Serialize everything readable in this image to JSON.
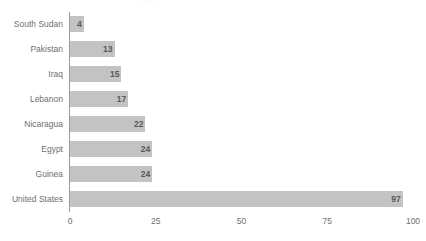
{
  "title_fragment": "stav",
  "chart_data": {
    "type": "bar",
    "orientation": "horizontal",
    "title": "",
    "xlabel": "",
    "ylabel": "",
    "xlim": [
      0,
      100
    ],
    "xticks": [
      "0",
      "25",
      "50",
      "75",
      "100"
    ],
    "grid": false,
    "legend": false,
    "bar_color": "#c3c3c3",
    "axis_color": "#9a9a9a",
    "label_color": "#6f6f6f",
    "value_color": "#585858",
    "categories": [
      "South Sudan",
      "Pakistan",
      "Iraq",
      "Lebanon",
      "Nicaragua",
      "Egypt",
      "Guinea",
      "United States"
    ],
    "values": [
      4,
      13,
      15,
      17,
      22,
      24,
      24,
      97
    ],
    "value_labels": [
      "4",
      "13",
      "15",
      "17",
      "22",
      "24",
      "24",
      "97"
    ]
  }
}
